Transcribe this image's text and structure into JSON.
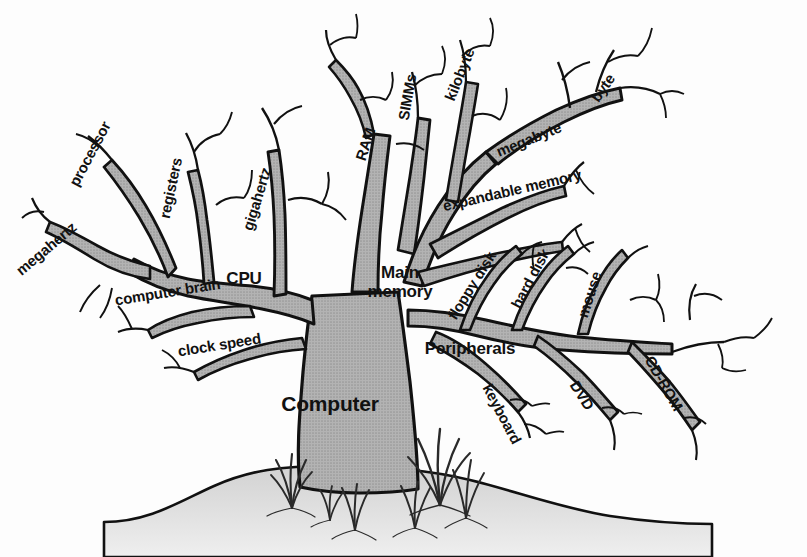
{
  "figure": {
    "kind": "concept-tree-diagram",
    "subject": "Computer",
    "background_color": "#fdfdfd",
    "trunk_fill_color": "#a9a9a9",
    "outline_color": "#111111",
    "ground_fill_color": "#d8d8d8",
    "text_color": "#111111"
  },
  "labels": {
    "trunk": {
      "text": "Computer",
      "x": 330,
      "y": 404,
      "rotate": 0,
      "size": "xl"
    },
    "branches": [
      {
        "id": "cpu",
        "text": "CPU",
        "x": 244,
        "y": 279,
        "rotate": 0,
        "size": "lg"
      },
      {
        "id": "main-memory",
        "text": "Main\nmemory",
        "x": 400,
        "y": 282,
        "rotate": 0,
        "size": "lg"
      },
      {
        "id": "peripherals",
        "text": "Peripherals",
        "x": 470,
        "y": 349,
        "rotate": 0,
        "size": "lg"
      },
      {
        "id": "megahertz",
        "text": "megahertz",
        "x": 18,
        "y": 272,
        "rotate": -40,
        "size": "md"
      },
      {
        "id": "processor",
        "text": "processor",
        "x": 73,
        "y": 185,
        "rotate": -62,
        "size": "md"
      },
      {
        "id": "registers",
        "text": "registers",
        "x": 164,
        "y": 218,
        "rotate": -78,
        "size": "md"
      },
      {
        "id": "gigahertz",
        "text": "gigahertz",
        "x": 247,
        "y": 230,
        "rotate": -73,
        "size": "md"
      },
      {
        "id": "computer-brain",
        "text": "computer brain",
        "x": 115,
        "y": 300,
        "rotate": -9,
        "size": "md"
      },
      {
        "id": "clock-speed",
        "text": "clock speed",
        "x": 178,
        "y": 351,
        "rotate": -9,
        "size": "md"
      },
      {
        "id": "ram",
        "text": "RAM",
        "x": 360,
        "y": 160,
        "rotate": -72,
        "size": "md"
      },
      {
        "id": "simms",
        "text": "SIMMs",
        "x": 403,
        "y": 120,
        "rotate": -80,
        "size": "md"
      },
      {
        "id": "kilobyte",
        "text": "kilobyte",
        "x": 449,
        "y": 100,
        "rotate": -68,
        "size": "md"
      },
      {
        "id": "byte",
        "text": "byte",
        "x": 594,
        "y": 100,
        "rotate": -55,
        "size": "md"
      },
      {
        "id": "megabyte",
        "text": "megabyte",
        "x": 497,
        "y": 152,
        "rotate": -22,
        "size": "md"
      },
      {
        "id": "expandable-memory",
        "text": "expandable memory",
        "x": 443,
        "y": 206,
        "rotate": -13,
        "size": "md"
      },
      {
        "id": "floppy-disk",
        "text": "floppy disk",
        "x": 451,
        "y": 318,
        "rotate": -58,
        "size": "md"
      },
      {
        "id": "hard-disk",
        "text": "hard disk",
        "x": 515,
        "y": 307,
        "rotate": -62,
        "size": "md"
      },
      {
        "id": "mouse",
        "text": "mouse",
        "x": 582,
        "y": 317,
        "rotate": -72,
        "size": "md"
      },
      {
        "id": "keyboard",
        "text": "keyboard",
        "x": 487,
        "y": 385,
        "rotate": 62,
        "size": "md"
      },
      {
        "id": "dvd",
        "text": "DVD",
        "x": 574,
        "y": 382,
        "rotate": 58,
        "size": "md"
      },
      {
        "id": "cd-rom",
        "text": "CD-ROM",
        "x": 649,
        "y": 357,
        "rotate": 60,
        "size": "md"
      }
    ]
  },
  "hierarchy": {
    "root": "Computer",
    "children": [
      {
        "name": "CPU",
        "children": [
          "megahertz",
          "processor",
          "registers",
          "gigahertz",
          "computer brain",
          "clock speed"
        ]
      },
      {
        "name": "Main memory",
        "children": [
          "RAM",
          "SIMMs",
          "kilobyte",
          "byte",
          "megabyte",
          "expandable memory"
        ]
      },
      {
        "name": "Peripherals",
        "children": [
          "floppy disk",
          "hard disk",
          "mouse",
          "keyboard",
          "DVD",
          "CD-ROM"
        ]
      }
    ]
  }
}
